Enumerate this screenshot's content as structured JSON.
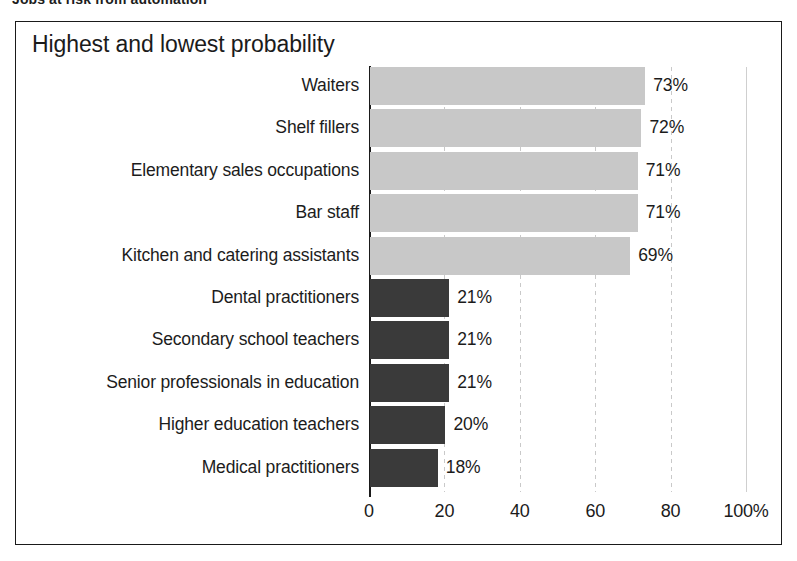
{
  "figure": {
    "heading": "Jobs at risk from automation",
    "title": "Highest and lowest probability"
  },
  "chart_data": {
    "type": "bar",
    "orientation": "horizontal",
    "title": "Highest and lowest probability",
    "xlabel": "",
    "ylabel": "",
    "xlim": [
      0,
      100
    ],
    "xticks": [
      0,
      20,
      40,
      60,
      80,
      100
    ],
    "xtick_labels": [
      "0",
      "20",
      "40",
      "60",
      "80",
      "100%"
    ],
    "grid": true,
    "legend": null,
    "value_suffix": "%",
    "categories": [
      "Waiters",
      "Shelf fillers",
      "Elementary sales occupations",
      "Bar staff",
      "Kitchen and catering assistants",
      "Dental practitioners",
      "Secondary school teachers",
      "Senior professionals in education",
      "Higher education teachers",
      "Medical practitioners"
    ],
    "values": [
      73,
      72,
      71,
      71,
      69,
      21,
      21,
      21,
      20,
      18
    ],
    "value_labels": [
      "73%",
      "72%",
      "71%",
      "71%",
      "69%",
      "21%",
      "21%",
      "21%",
      "20%",
      "18%"
    ],
    "groups": [
      "highest",
      "highest",
      "highest",
      "highest",
      "highest",
      "lowest",
      "lowest",
      "lowest",
      "lowest",
      "lowest"
    ],
    "colors": {
      "highest": "#c8c8c8",
      "lowest": "#3a3a3a",
      "axis": "#1a1a1a",
      "grid": "#cfcfcf",
      "text": "#1b1b1b",
      "background": "#ffffff"
    }
  }
}
